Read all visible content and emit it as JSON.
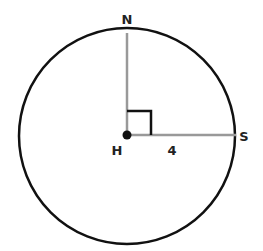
{
  "diagram": {
    "type": "circle-geometry",
    "circle": {
      "center": [
        127,
        135
      ],
      "radius": 108,
      "stroke": "#111111"
    },
    "points": {
      "center": {
        "label": "H",
        "x": 127,
        "y": 135
      },
      "top": {
        "label": "N",
        "x": 127,
        "y": 33
      },
      "right": {
        "label": "S",
        "x": 235,
        "y": 135
      }
    },
    "segments": [
      {
        "from": "H",
        "to": "N",
        "color": "#999999"
      },
      {
        "from": "H",
        "to": "S",
        "color": "#999999"
      }
    ],
    "segment_label": "4",
    "right_angle_marker": true
  }
}
